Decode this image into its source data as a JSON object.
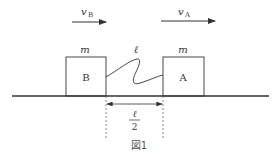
{
  "figure": {
    "caption": "図1",
    "velocity_b": {
      "symbol": "v",
      "subscript": "B"
    },
    "velocity_a": {
      "symbol": "v",
      "subscript": "A"
    },
    "block_b": {
      "label": "B",
      "mass": "m"
    },
    "block_a": {
      "label": "A",
      "mass": "m"
    },
    "spring_length": "ℓ",
    "gap": {
      "numerator": "ℓ",
      "denominator": "2"
    }
  },
  "colors": {
    "line": "#333333",
    "background": "#ffffff"
  }
}
